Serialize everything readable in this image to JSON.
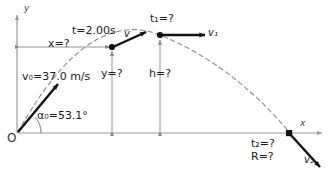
{
  "figure": {
    "kind": "projectile-motion-diagram",
    "axes": {
      "y_label": "y",
      "x_label": "x",
      "origin_label": "O"
    },
    "colors": {
      "axis": "#9a9a9a",
      "trajectory": "#8c8c8c",
      "vector": "#111111",
      "dimension": "#8a8a8a",
      "text": "#1a1a1a"
    },
    "annotations": {
      "initial_speed": "v₀=37.0 m/s",
      "initial_angle": "α₀=53.1°",
      "time_at_point": "t=2.00s",
      "horizontal_distance": "x=?",
      "vertical_height": "y=?",
      "max_height": "h=?",
      "apex_time": "t₁=?",
      "landing_time": "t₂=?",
      "range": "R=?"
    },
    "vectors": [
      {
        "name": "v0",
        "label": "v₀",
        "label_text": "v₀=37.0 m/s"
      },
      {
        "name": "v",
        "label": "v"
      },
      {
        "name": "v1",
        "label": "v₁"
      },
      {
        "name": "v2",
        "label": "v₂"
      }
    ],
    "points": [
      {
        "name": "launch-point",
        "label": "O"
      },
      {
        "name": "t2-point",
        "label": "t=2.00s"
      },
      {
        "name": "apex-point",
        "label": "t₁=?"
      },
      {
        "name": "landing-point",
        "label": "t₂=?"
      }
    ]
  }
}
